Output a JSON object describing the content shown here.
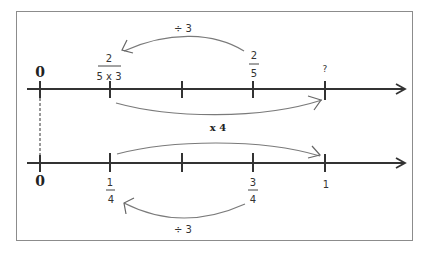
{
  "diagram": {
    "title": "",
    "top_line": {
      "zero_label": "0",
      "ticks": [
        {
          "pos": 0,
          "label": "0"
        },
        {
          "pos": 1,
          "label_num": "2",
          "label_den": "5 x 3"
        },
        {
          "pos": 2,
          "label": ""
        },
        {
          "pos": 3,
          "label_num": "2",
          "label_den": "5"
        },
        {
          "pos": 4,
          "label": "?"
        }
      ],
      "arc_top_label": "÷ 3",
      "arc_top_from": "2/5",
      "arc_top_to": "2/(5x3)"
    },
    "middle_label": "x 4",
    "bottom_line": {
      "ticks": [
        {
          "pos": 0,
          "label": "0"
        },
        {
          "pos": 1,
          "label_num": "1",
          "label_den": "4"
        },
        {
          "pos": 2,
          "label": ""
        },
        {
          "pos": 3,
          "label_num": "3",
          "label_den": "4"
        },
        {
          "pos": 4,
          "label": "1"
        }
      ],
      "arc_bottom_label": "÷ 3",
      "arc_bottom_from": "3/4",
      "arc_bottom_to": "1/4"
    },
    "labels": {
      "top_zero": "0",
      "top_frac1_num": "2",
      "top_frac1_den": "5 x 3",
      "top_frac2_num": "2",
      "top_frac2_den": "5",
      "top_question": "?",
      "top_div": "÷ 3",
      "mid_mult": "x 4",
      "bot_zero": "0",
      "bot_frac1_num": "1",
      "bot_frac1_den": "4",
      "bot_frac2_num": "3",
      "bot_frac2_den": "4",
      "bot_one": "1",
      "bot_div": "÷ 3"
    },
    "colors": {
      "axis": "#333333",
      "arc": "#7a7a7a",
      "frame": "#8c8c8c"
    }
  }
}
